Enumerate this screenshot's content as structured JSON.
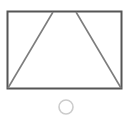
{
  "figure": {
    "title": "Rectangle with inscribed triangle",
    "canvas": {
      "width": 130,
      "height": 119,
      "background_color": "#ffffff"
    },
    "shapes": {
      "rectangle": {
        "label": "rectangle-outline",
        "x": 7.5,
        "y": 11.5,
        "width": 114,
        "height": 77,
        "stroke_color": "#555555",
        "stroke_width": 2,
        "fill_color": "#ffffff"
      },
      "triangle_left_edge": {
        "label": "triangle-left-edge",
        "x1": 8,
        "y1": 88,
        "x2": 53,
        "y2": 12,
        "stroke_color": "#7d7d7d",
        "stroke_width": 1.6
      },
      "triangle_right_edge": {
        "label": "triangle-right-edge",
        "x1": 76,
        "y1": 12,
        "x2": 121,
        "y2": 88,
        "stroke_color": "#7d7d7d",
        "stroke_width": 1.6
      },
      "circle": {
        "label": "circle-outline",
        "cx": 66,
        "cy": 107,
        "r": 7,
        "stroke_color": "#cccccc",
        "stroke_width": 1.6,
        "fill_color": "#ffffff"
      }
    }
  }
}
